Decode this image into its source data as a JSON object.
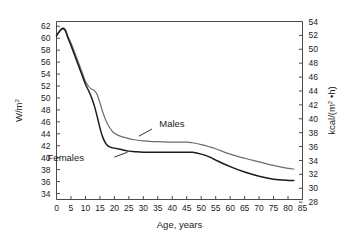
{
  "chart_data": {
    "type": "line",
    "title": "",
    "xlabel": "Age, years",
    "ylabel": "W/m2",
    "ylabel_display": "W/m",
    "ylabel_sup": "2",
    "y2label_display": "kcal/(m",
    "y2label_sup": "2",
    "y2label_tail": " •h)",
    "y2label": "kcal/(m2 •h)",
    "xlim": [
      0,
      85
    ],
    "ylim": [
      33,
      62.8
    ],
    "y2lim": [
      28.38,
      54.0
    ],
    "xticks": [
      0,
      5,
      10,
      15,
      20,
      25,
      30,
      35,
      40,
      45,
      50,
      55,
      60,
      65,
      70,
      75,
      80,
      85
    ],
    "yticks": [
      34,
      36,
      38,
      40,
      42,
      44,
      46,
      48,
      50,
      52,
      54,
      56,
      58,
      60,
      62
    ],
    "y2ticks": [
      28,
      30,
      32,
      34,
      36,
      38,
      40,
      42,
      44,
      46,
      48,
      50,
      52,
      54
    ],
    "grid": false,
    "legend_position": "inline-annotations",
    "colors": {
      "males": "#6d6d6d",
      "females": "#1b1b1b",
      "axis": "#4a4a4a",
      "background": "#ffffff"
    },
    "series": [
      {
        "name": "Males",
        "color": "#6d6d6d",
        "label_x": 35.5,
        "label_y": 45.6,
        "leader": [
          [
            33.0,
            44.8
          ],
          [
            28.5,
            43.6
          ]
        ],
        "x": [
          0,
          1,
          2,
          3,
          4,
          5,
          6,
          7,
          8,
          9,
          10,
          11,
          12,
          13,
          14,
          15,
          16,
          17,
          18,
          19,
          20,
          22,
          25,
          27,
          30,
          33,
          35,
          40,
          45,
          47,
          50,
          53,
          55,
          60,
          65,
          70,
          75,
          80,
          82
        ],
        "y": [
          60.5,
          61.2,
          61.7,
          61.5,
          60.3,
          59.2,
          58.0,
          56.7,
          55.4,
          54.1,
          52.8,
          52.0,
          51.5,
          51.3,
          50.6,
          49.2,
          47.6,
          46.3,
          45.3,
          44.6,
          44.1,
          43.6,
          43.2,
          43.0,
          42.8,
          42.7,
          42.7,
          42.6,
          42.6,
          42.5,
          42.2,
          41.8,
          41.5,
          40.6,
          39.9,
          39.3,
          38.7,
          38.2,
          38.1
        ]
      },
      {
        "name": "Females",
        "color": "#1b1b1b",
        "label_x": 9.5,
        "label_y": 40.0,
        "leader": [
          [
            20.0,
            40.1
          ],
          [
            24.5,
            40.9
          ]
        ],
        "x": [
          0,
          1,
          2,
          3,
          4,
          5,
          6,
          7,
          8,
          9,
          10,
          11,
          12,
          13,
          14,
          15,
          16,
          17,
          18,
          19,
          20,
          22,
          25,
          27,
          30,
          35,
          40,
          45,
          47,
          50,
          53,
          55,
          60,
          65,
          70,
          75,
          80,
          82
        ],
        "y": [
          60.4,
          61.1,
          61.6,
          61.3,
          60.0,
          58.8,
          57.5,
          56.2,
          54.9,
          53.6,
          52.3,
          51.3,
          50.2,
          48.8,
          47.0,
          45.0,
          43.4,
          42.4,
          41.9,
          41.7,
          41.6,
          41.4,
          41.1,
          41.0,
          40.9,
          40.9,
          40.9,
          40.9,
          40.9,
          40.6,
          40.1,
          39.6,
          38.5,
          37.6,
          36.9,
          36.4,
          36.2,
          36.2
        ]
      }
    ]
  },
  "figure": {
    "males_label": "Males",
    "females_label": "Females"
  }
}
